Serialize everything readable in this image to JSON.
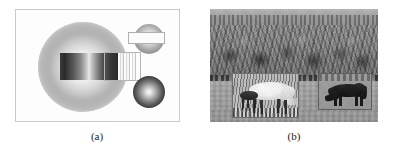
{
  "figure": {
    "panels": [
      {
        "id": "panel-a",
        "caption": "(a)",
        "kind": "synthetic-shading-diagram",
        "frame_color": "#c9c9c9",
        "background_color": "#fdfdfd",
        "objects": [
          {
            "name": "large-sphere",
            "shading": "radial-gradient",
            "center_tone": "white",
            "edge_tone": "light-gray"
          },
          {
            "name": "horizontal-dark-bar",
            "overlays": "large-sphere",
            "tone": "dark"
          },
          {
            "name": "sampled-strip",
            "pattern": "vertical-stripes",
            "tone": "light"
          },
          {
            "name": "strip-bounding-box",
            "border_color": "#b4b4b4"
          },
          {
            "name": "small-sphere-upper-right",
            "shading": "radial-gradient",
            "tone": "mid-gray"
          },
          {
            "name": "upper-right-rectangle",
            "fill": "#fbfbfb",
            "border_color": "#b0b0b0"
          },
          {
            "name": "small-sphere-lower-right",
            "shading": "radial-gradient",
            "center_tone": "white",
            "edge_tone": "near-black"
          }
        ]
      },
      {
        "id": "panel-b",
        "caption": "(b)",
        "kind": "grayscale-photograph",
        "scene": "horses grazing in a field in front of a tree line",
        "regions": [
          {
            "name": "sky-band",
            "tone": "light-gray"
          },
          {
            "name": "tree-line",
            "tone": "dark-gray, textured"
          },
          {
            "name": "grass-field",
            "tone": "mid-gray"
          }
        ],
        "detection_boxes": [
          {
            "name": "inset-left",
            "contents": "light-colored horse with dark foal",
            "border_color": "#6f6f6f"
          },
          {
            "name": "inset-right",
            "contents": "dark horse grazing",
            "border_color": "#5e5e5e"
          }
        ]
      }
    ]
  }
}
